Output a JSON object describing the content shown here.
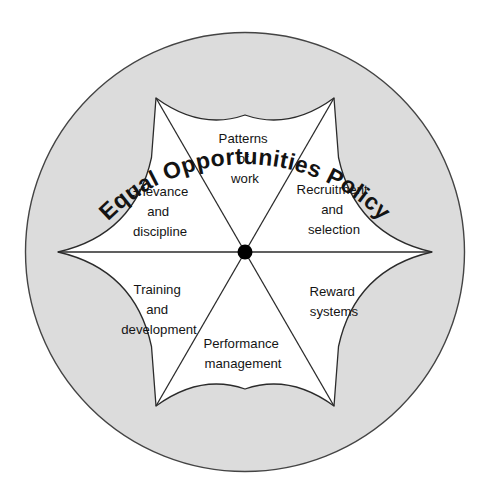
{
  "diagram": {
    "title": "Equal Opportunities Policy",
    "center_node": "hub",
    "shape": "six-pointed concave star inside circle",
    "colors": {
      "outer_ring_fill": "#dcdcdc",
      "star_fill": "#ffffff",
      "stroke": "#2b2b2b",
      "hub_fill": "#000000",
      "text": "#141414",
      "background": "#ffffff"
    },
    "geometry": {
      "circle_center_x": 245,
      "circle_center_y": 252,
      "circle_radius": 220,
      "star_point_radius": 187,
      "hub_radius": 7,
      "sector_count": 6
    },
    "segments": [
      {
        "id": "patterns-of-work",
        "name": "Patterns of work",
        "position": "top",
        "lines": [
          "Patterns",
          "of",
          "work"
        ],
        "label_x": 245,
        "label_y": 143
      },
      {
        "id": "recruitment-and-selection",
        "name": "Recruitment and selection",
        "position": "upper-right",
        "lines": [
          "Recruitment",
          "and",
          "selection"
        ],
        "label_x": 334,
        "label_y": 194
      },
      {
        "id": "reward-systems",
        "name": "Reward systems",
        "position": "lower-right",
        "lines": [
          "Reward",
          "systems"
        ],
        "label_x": 334,
        "label_y": 296
      },
      {
        "id": "performance-management",
        "name": "Performance management",
        "position": "bottom",
        "lines": [
          "Performance",
          "management"
        ],
        "label_x": 243,
        "label_y": 348
      },
      {
        "id": "training-and-development",
        "name": "Training and development",
        "position": "lower-left",
        "lines": [
          "Training",
          "and",
          "development"
        ],
        "label_x": 159,
        "label_y": 294
      },
      {
        "id": "grievance-and-discipline",
        "name": "Grievance and discipline",
        "position": "upper-left",
        "lines": [
          "Grievance",
          "and",
          "discipline"
        ],
        "label_x": 160,
        "label_y": 196
      }
    ]
  }
}
